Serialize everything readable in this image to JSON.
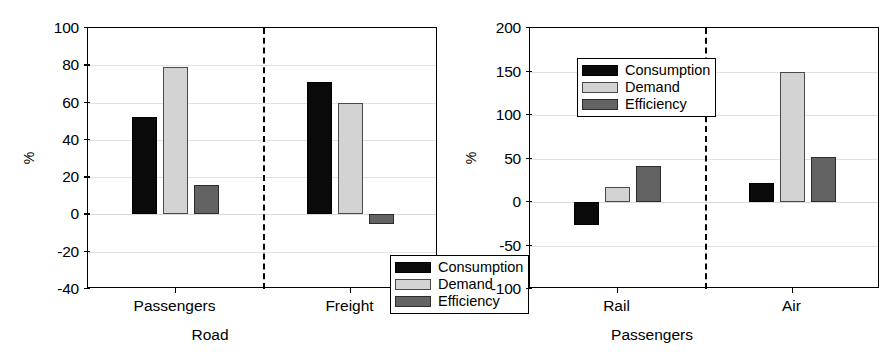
{
  "chart_data": [
    {
      "id": "road",
      "type": "bar",
      "title": "",
      "xlabel": "Road",
      "ylabel": "%",
      "ylim": [
        -40,
        100
      ],
      "yticks": [
        -40,
        -20,
        0,
        20,
        40,
        60,
        80,
        100
      ],
      "ytick_labels": [
        "-40",
        "-20",
        "0",
        "20",
        "40",
        "60",
        "80",
        "100"
      ],
      "grid": true,
      "legend_position": "bottom-right",
      "group_separator": true,
      "categories": [
        "Passengers",
        "Freight"
      ],
      "series": [
        {
          "name": "Consumption",
          "color": "#0a0a0a",
          "values": [
            52,
            71
          ]
        },
        {
          "name": "Demand",
          "color": "#d3d3d3",
          "values": [
            79,
            60
          ]
        },
        {
          "name": "Efficiency",
          "color": "#636363",
          "values": [
            16,
            -5
          ]
        }
      ]
    },
    {
      "id": "passengers",
      "type": "bar",
      "title": "",
      "xlabel": "Passengers",
      "ylabel": "%",
      "ylim": [
        -100,
        200
      ],
      "yticks": [
        -100,
        -50,
        0,
        50,
        100,
        150,
        200
      ],
      "ytick_labels": [
        "-100",
        "-50",
        "0",
        "50",
        "100",
        "150",
        "200"
      ],
      "grid": true,
      "legend_position": "top-left",
      "group_separator": true,
      "categories": [
        "Rail",
        "Air"
      ],
      "series": [
        {
          "name": "Consumption",
          "color": "#0a0a0a",
          "values": [
            -27,
            22
          ]
        },
        {
          "name": "Demand",
          "color": "#d3d3d3",
          "values": [
            17,
            150
          ]
        },
        {
          "name": "Efficiency",
          "color": "#636363",
          "values": [
            41,
            52
          ]
        }
      ]
    }
  ]
}
